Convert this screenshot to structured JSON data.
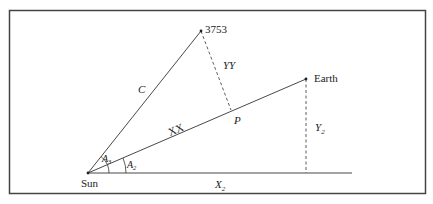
{
  "diagram": {
    "points": {
      "sun": {
        "label": "Sun",
        "x": 88,
        "y": 173
      },
      "asteroid": {
        "label": "3753",
        "x": 201,
        "y": 31
      },
      "earth": {
        "label": "Earth",
        "x": 306,
        "y": 79
      },
      "p": {
        "label": "P",
        "x": 231,
        "y": 110
      }
    },
    "segment_labels": {
      "c": "C",
      "yy": "YY",
      "xx": "XX",
      "y2_base": "Y",
      "y2_sub": "2",
      "x2_base": "X",
      "x2_sub": "2"
    },
    "angles": {
      "a3_base": "A",
      "a3_sub": "3",
      "a2_base": "A",
      "a2_sub": "2"
    },
    "colors": {
      "line": "#333333",
      "border": "#444444"
    }
  }
}
